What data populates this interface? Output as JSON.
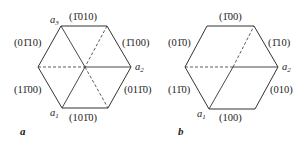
{
  "panels": [
    {
      "id": "a",
      "panel_label": "a",
      "vertex_labels": {
        "a1": "a",
        "a1_sub": "1",
        "a2": "a",
        "a2_sub": "2",
        "a3": "a",
        "a3_sub": "3"
      },
      "edge_labels": {
        "top": "(1̄010)",
        "upper_left": "(01̄10)",
        "upper_right": "(1̄100)",
        "lower_left": "(11̄00)",
        "lower_right": "(011̄0)",
        "bottom": "(101̄0)"
      }
    },
    {
      "id": "b",
      "panel_label": "b",
      "vertex_labels": {
        "a1": "a",
        "a1_sub": "1",
        "a2": "a",
        "a2_sub": "2"
      },
      "edge_labels": {
        "top": "(1̄00)",
        "upper_left": "(01̄0)",
        "upper_right": "(1̄10)",
        "lower_left": "(11̄0)",
        "lower_right": "(010)",
        "bottom": "(100)"
      }
    }
  ],
  "colors": {
    "line": "#333333",
    "text": "#222222"
  }
}
